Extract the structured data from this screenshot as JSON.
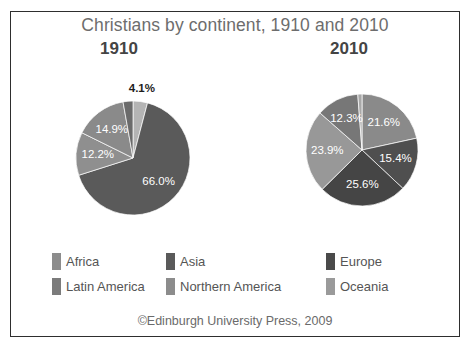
{
  "figure": {
    "title": "Christians by continent, 1910 and 2010",
    "credit": "©Edinburgh University Press, 2009",
    "frame_color": "#2e2e2e",
    "background": "#ffffff",
    "title_color": "#6d6d6d"
  },
  "panels": [
    {
      "heading": "1910"
    },
    {
      "heading": "2010"
    }
  ],
  "legend": {
    "columns": [
      {
        "items": [
          {
            "label": "Africa",
            "color": "#8c8c8c"
          },
          {
            "label": "Latin America",
            "color": "#7b7b7b"
          }
        ]
      },
      {
        "items": [
          {
            "label": "Asia",
            "color": "#5a5a5a"
          },
          {
            "label": "Northern America",
            "color": "#8c8c8c"
          }
        ]
      },
      {
        "items": [
          {
            "label": "Europe",
            "color": "#4a4a4a"
          },
          {
            "label": "Oceania",
            "color": "#9a9a9a"
          }
        ]
      }
    ]
  },
  "chart_data": [
    {
      "type": "pie",
      "title": "1910",
      "label_suffix": "%",
      "start_angle_deg": 0,
      "direction": "clockwise",
      "categories": [
        "Northern America",
        "Asia",
        "Latin America",
        "Africa",
        "Europe",
        "Oceania"
      ],
      "slices": [
        {
          "name": "Northern America",
          "value": 4.1,
          "label": "4.1%",
          "color": "#b4b4b4",
          "label_outside": true
        },
        {
          "name": "Europe",
          "value": 66.0,
          "label": "66.0%",
          "color": "#5a5a5a",
          "label_outside": false
        },
        {
          "name": "Latin America",
          "value": 12.2,
          "label": "12.2%",
          "color": "#8f8f8f",
          "label_outside": false
        },
        {
          "name": "Africa",
          "value": 14.9,
          "label": "14.9%",
          "color": "#8a8a8a",
          "label_outside": false
        },
        {
          "name": "Asia",
          "value": 2.8,
          "label": "",
          "color": "#6b6b6b",
          "label_outside": false
        }
      ],
      "legend_position": "bottom"
    },
    {
      "type": "pie",
      "title": "2010",
      "label_suffix": "%",
      "start_angle_deg": 0,
      "direction": "clockwise",
      "categories": [
        "Africa",
        "Asia",
        "Europe",
        "Latin America",
        "Northern America",
        "Oceania"
      ],
      "slices": [
        {
          "name": "Africa",
          "value": 21.6,
          "label": "21.6%",
          "color": "#8a8a8a",
          "label_outside": false
        },
        {
          "name": "Asia",
          "value": 15.4,
          "label": "15.4%",
          "color": "#4f4f4f",
          "label_outside": false
        },
        {
          "name": "Europe",
          "value": 25.6,
          "label": "25.6%",
          "color": "#454545",
          "label_outside": false
        },
        {
          "name": "Latin America",
          "value": 23.9,
          "label": "23.9%",
          "color": "#989898",
          "label_outside": false
        },
        {
          "name": "Northern America",
          "value": 12.3,
          "label": "12.3%",
          "color": "#777777",
          "label_outside": false
        },
        {
          "name": "Oceania",
          "value": 1.2,
          "label": "",
          "color": "#a8a8a8",
          "label_outside": false
        }
      ],
      "legend_position": "bottom"
    }
  ]
}
